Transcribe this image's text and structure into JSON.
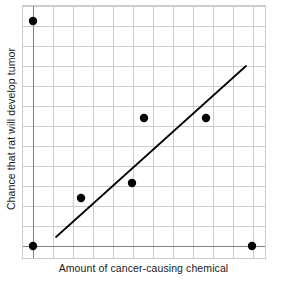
{
  "chart_data": {
    "type": "scatter",
    "title": "",
    "xlabel": "Amount of cancer-causing chemical",
    "ylabel": "Chance that rat will develop tumor",
    "grid": true,
    "legend": "none",
    "axis_ticks": "none",
    "xlim": [
      0,
      12
    ],
    "ylim": [
      0,
      12
    ],
    "colors": {
      "point": "#000000",
      "trend_line": "#000000",
      "grid_line": "#cccccc",
      "axis_line": "#808080",
      "background": "#ffffff",
      "text": "#1a1a1a"
    },
    "points": [
      {
        "x": 0.5,
        "y": 11.2
      },
      {
        "x": 0.5,
        "y": 0.0
      },
      {
        "x": 2.9,
        "y": 2.4
      },
      {
        "x": 5.4,
        "y": 3.2
      },
      {
        "x": 6.0,
        "y": 6.4
      },
      {
        "x": 9.1,
        "y": 6.4
      },
      {
        "x": 11.5,
        "y": 0.0
      }
    ],
    "trend_line": {
      "label": "line of best fit",
      "x_start": 1.7,
      "y_start": 0.45,
      "x_end": 11.2,
      "y_end": 9.0
    },
    "pixel_geometry": {
      "plot_left": 22,
      "plot_right": 265,
      "plot_top": 5,
      "plot_bottom": 258,
      "axis_x_pixel": 33,
      "axis_y_pixel": 246,
      "grid_step": 20,
      "point_radius": 4.2,
      "points_px": [
        {
          "cx": 33,
          "cy": 21
        },
        {
          "cx": 33,
          "cy": 246
        },
        {
          "cx": 81,
          "cy": 198
        },
        {
          "cx": 132,
          "cy": 183
        },
        {
          "cx": 144,
          "cy": 118
        },
        {
          "cx": 206,
          "cy": 118
        },
        {
          "cx": 252,
          "cy": 246
        }
      ],
      "trend_px": {
        "x1": 56,
        "y1": 237,
        "x2": 246,
        "y2": 66
      }
    }
  }
}
